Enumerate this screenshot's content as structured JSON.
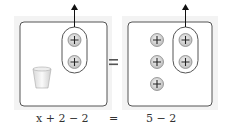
{
  "diagram": {
    "left_side": {
      "items": [
        "cup",
        "plus-counter",
        "plus-counter"
      ],
      "removed_group_count": 2,
      "label": "x + 2 − 2"
    },
    "right_side": {
      "counter_count": 5,
      "removed_group_count": 2,
      "label": "5 − 2"
    },
    "equals_sign": "=",
    "equation_equals": "=",
    "counter_symbol": "+",
    "colors": {
      "frame_border": "#555555",
      "frame_bg": "#f2f2f2",
      "counter_fill": "#d9d9d9",
      "counter_stroke": "#8a8a8a",
      "arrow": "#111111"
    }
  }
}
